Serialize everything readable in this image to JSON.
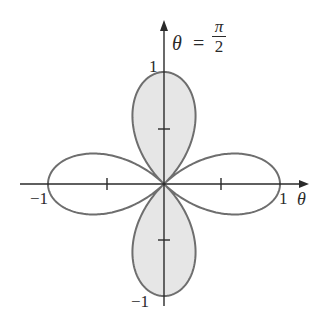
{
  "figure": {
    "curve_color": "#6e6e6e",
    "shade_color": "#e6e6e6",
    "axis_color": "#2a2a2a"
  },
  "labels": {
    "theta_symbol": "θ",
    "equals": "=",
    "pi_num": "π",
    "pi_den": "2",
    "x_axis_label": "θ",
    "x_neg_one": "−1",
    "x_pos_one": "1",
    "y_pos_one": "1",
    "y_neg_one": "−1"
  },
  "chart_data": {
    "type": "line",
    "title": "",
    "equation": "r = cos 2θ",
    "xlabel": "θ",
    "ylabel": "",
    "xlim": [
      -1,
      1
    ],
    "ylim": [
      -1,
      1
    ],
    "x_ticks": [
      -1,
      -0.5,
      0.5,
      1
    ],
    "y_ticks": [
      -1,
      -0.5,
      0.5,
      1
    ],
    "x_tick_labels": [
      "−1",
      "1"
    ],
    "y_tick_labels": [
      "1",
      "−1"
    ],
    "annotations": [
      "θ = π/2"
    ],
    "shaded_regions": [
      "upper petal (around θ = π/2)",
      "lower petal (around θ = 3π/2)"
    ],
    "grid": false,
    "legend": false
  }
}
